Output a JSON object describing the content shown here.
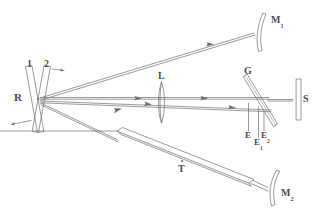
{
  "figure": {
    "type": "optical-setup-diagram",
    "background_color": "#ffffff",
    "line_color": "#6e6e6e",
    "label_color": "#4a4a4a"
  },
  "labels": {
    "source_r": "R",
    "electrode_1": "1",
    "electrode_2": "2",
    "mirror_1": "M",
    "mirror_1_sub": "1",
    "mirror_2": "M",
    "mirror_2_sub": "2",
    "lens": "L",
    "grating": "G",
    "slit": "S",
    "tube": "T",
    "detector_e": "E",
    "detector_e1": "E",
    "detector_e1_sub": "1",
    "detector_e2": "E",
    "detector_e2_sub": "2"
  },
  "components": [
    {
      "name": "R",
      "kind": "crossed-discharge-source",
      "position": "left"
    },
    {
      "name": "1",
      "kind": "electrode",
      "position": "upper-left"
    },
    {
      "name": "2",
      "kind": "electrode",
      "position": "upper-left"
    },
    {
      "name": "M1",
      "kind": "concave-mirror",
      "position": "top-right"
    },
    {
      "name": "M2",
      "kind": "concave-mirror",
      "position": "bottom-right"
    },
    {
      "name": "L",
      "kind": "biconvex-lens",
      "position": "center"
    },
    {
      "name": "G",
      "kind": "beamsplitter-plate",
      "position": "center-right"
    },
    {
      "name": "S",
      "kind": "slit",
      "position": "right"
    },
    {
      "name": "T",
      "kind": "absorption-tube",
      "position": "bottom-center"
    },
    {
      "name": "E",
      "kind": "detector",
      "position": "below-G"
    },
    {
      "name": "E1",
      "kind": "detector",
      "position": "below-G"
    },
    {
      "name": "E2",
      "kind": "detector",
      "position": "below-G"
    }
  ],
  "beams": [
    {
      "from": "R",
      "to": "M1",
      "direction": "left-to-right",
      "arrow": true
    },
    {
      "from": "R",
      "to": "L",
      "direction": "left-to-right",
      "arrow": true,
      "count": 2
    },
    {
      "from": "L",
      "to": "G",
      "direction": "left-to-right",
      "arrow": true
    },
    {
      "from": "R",
      "to": "T",
      "direction": "left-to-right",
      "arrow": true
    },
    {
      "from": "T",
      "to": "M2",
      "direction": "left-to-right",
      "arrow": false
    },
    {
      "from": "R",
      "to": "outside-left",
      "direction": "right-to-left",
      "arrow": true
    }
  ]
}
